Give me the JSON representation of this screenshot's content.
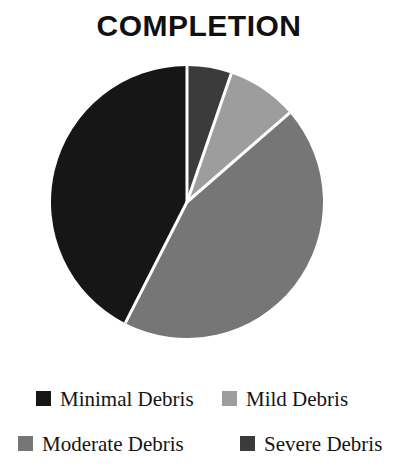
{
  "chart_data": {
    "type": "pie",
    "title": "COMPLETION",
    "xlabel": "",
    "ylabel": "",
    "legend_position": "bottom",
    "grid": false,
    "start_angle_deg": 0,
    "direction": "clockwise",
    "categories": [
      "Minimal Debris",
      "Mild Debris",
      "Moderate Debris",
      "Severe Debris"
    ],
    "values": [
      43,
      8,
      44,
      5
    ],
    "unit": "percent",
    "slice_colors": [
      "#161616",
      "#9d9d9d",
      "#767676",
      "#3b3b3b"
    ],
    "slices": [
      {
        "label": "Severe Debris",
        "value": 5,
        "color": "#3b3b3b",
        "start_deg": 0,
        "end_deg": 19
      },
      {
        "label": "Mild Debris",
        "value": 8,
        "color": "#9d9d9d",
        "start_deg": 19,
        "end_deg": 49
      },
      {
        "label": "Moderate Debris",
        "value": 44,
        "color": "#767676",
        "start_deg": 49,
        "end_deg": 207
      },
      {
        "label": "Minimal Debris",
        "value": 43,
        "color": "#161616",
        "start_deg": 207,
        "end_deg": 360
      }
    ],
    "separator_color": "#ffffff",
    "background": "#ffffff"
  },
  "title": {
    "text": "COMPLETION"
  },
  "legend": {
    "rows": [
      {
        "items": [
          {
            "label": "Minimal Debris",
            "color": "#161616"
          },
          {
            "label": "Mild Debris",
            "color": "#9d9d9d"
          }
        ]
      },
      {
        "items": [
          {
            "label": "Moderate Debris",
            "color": "#767676"
          },
          {
            "label": "Severe Debris",
            "color": "#3b3b3b"
          }
        ]
      }
    ]
  }
}
